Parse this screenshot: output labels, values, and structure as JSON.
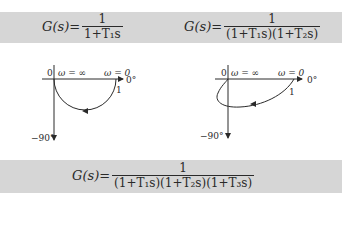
{
  "formulas": {
    "first_order": {
      "lhs": "G(s)=",
      "numerator": "1",
      "denominator": "1+T₁s"
    },
    "second_order": {
      "lhs": "G(s)=",
      "numerator": "1",
      "denominator": "(1+T₁s)(1+T₂s)"
    },
    "third_order": {
      "lhs": "G(s)=",
      "numerator": "1",
      "denominator": "(1+T₁s)(1+T₂s)(1+T₃s)"
    }
  },
  "plots": {
    "left": {
      "origin_label": "0",
      "omega_inf_label": "ω = ∞",
      "omega_zero_label": "ω = 0",
      "zero_deg_label": "0°",
      "minus90_label": "−90°",
      "unit_label": "1"
    },
    "right": {
      "origin_label": "0",
      "omega_inf_label": "ω = ∞",
      "omega_zero_label": "ω = 0",
      "zero_deg_label": "0°",
      "minus90_label": "−90°",
      "unit_label": "1"
    }
  },
  "colors": {
    "band": "#d6d6d6",
    "ink": "#2a2a2a"
  }
}
